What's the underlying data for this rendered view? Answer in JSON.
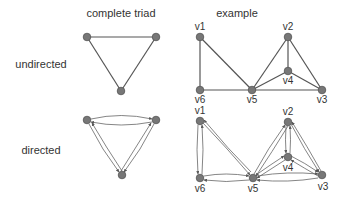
{
  "headers": {
    "triad": "complete triad",
    "example": "example"
  },
  "rows": {
    "undirected": "undirected",
    "directed": "directed"
  },
  "colors": {
    "node_fill": "#777777",
    "edge": "#555555",
    "text": "#333333"
  },
  "triad": {
    "nodes": [
      "a",
      "b",
      "c"
    ],
    "edges": [
      [
        "a",
        "b"
      ],
      [
        "b",
        "c"
      ],
      [
        "a",
        "c"
      ]
    ]
  },
  "example": {
    "vertex_labels": {
      "v1": "v1",
      "v2": "v2",
      "v3": "v3",
      "v4": "v4",
      "v5": "v5",
      "v6": "v6"
    },
    "undirected_edges": [
      [
        "v1",
        "v6"
      ],
      [
        "v1",
        "v5"
      ],
      [
        "v6",
        "v5"
      ],
      [
        "v5",
        "v2"
      ],
      [
        "v5",
        "v4"
      ],
      [
        "v5",
        "v3"
      ],
      [
        "v2",
        "v4"
      ],
      [
        "v2",
        "v3"
      ],
      [
        "v4",
        "v3"
      ]
    ],
    "directed_edges_note": "each undirected edge replaced by a pair of opposing arcs"
  }
}
